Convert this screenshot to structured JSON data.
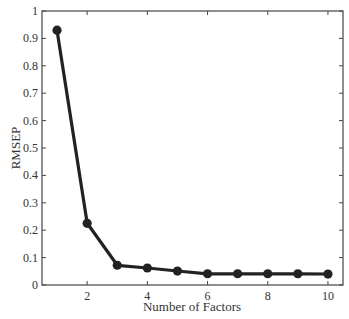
{
  "chart_data": {
    "type": "line",
    "title": "",
    "xlabel": "Number of Factors",
    "ylabel": "RMSEP",
    "x": [
      1,
      2,
      3,
      4,
      5,
      6,
      7,
      8,
      9,
      10
    ],
    "series": [
      {
        "name": "RMSEP",
        "values": [
          0.93,
          0.225,
          0.072,
          0.062,
          0.051,
          0.041,
          0.041,
          0.041,
          0.041,
          0.04
        ],
        "color": "#222222",
        "marker": "circle"
      }
    ],
    "xlim": [
      0.5,
      10.5
    ],
    "ylim": [
      0,
      1
    ],
    "xticks": [
      2,
      4,
      6,
      8,
      10
    ],
    "yticks": [
      0,
      0.1,
      0.2,
      0.3,
      0.4,
      0.5,
      0.6,
      0.7,
      0.8,
      0.9,
      1
    ],
    "ytick_labels": [
      "0",
      "0.1",
      "0.2",
      "0.3",
      "0.4",
      "0.5",
      "0.6",
      "0.7",
      "0.8",
      "0.9",
      "1"
    ],
    "xtick_labels": [
      "2",
      "4",
      "6",
      "8",
      "10"
    ],
    "grid": false,
    "legend": null
  }
}
